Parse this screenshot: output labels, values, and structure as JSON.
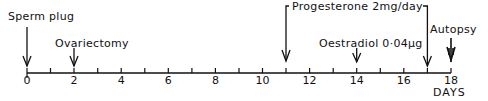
{
  "diagram": {
    "type": "timeline",
    "axis": {
      "unit_label": "DAYS",
      "min": 0,
      "max": 18,
      "major_ticks": [
        "0",
        "2",
        "4",
        "6",
        "8",
        "10",
        "12",
        "14",
        "16",
        "18"
      ]
    },
    "events": [
      {
        "label": "Sperm plug",
        "day": 0
      },
      {
        "label": "Ovariectomy",
        "day": 2
      },
      {
        "label": "Progesterone 2mg/day",
        "day_start": 11,
        "day_end": 17
      },
      {
        "label": "Oestradiol 0·04µg",
        "day": 14
      },
      {
        "label": "Autopsy",
        "day": 18
      }
    ]
  }
}
